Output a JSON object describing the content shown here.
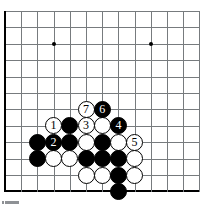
{
  "figure": {
    "kind": "go-board-diagram",
    "caption": "",
    "colors": {
      "background": "#ffffff",
      "grid_line": "#777b7e",
      "board_edge": "#000000",
      "black_stone": "#000000",
      "white_stone": "#ffffff",
      "star_point": "#000000"
    }
  },
  "board": {
    "columns": 13,
    "rows": 12,
    "origin_x": 5,
    "origin_y": 11,
    "spacing_x": 16.2,
    "spacing_y": 16.4,
    "left_edge_is_board_boundary": true,
    "bottom_edge_is_board_boundary": true,
    "star_points": [
      {
        "col": 3,
        "row": 2
      },
      {
        "col": 9,
        "row": 2
      }
    ]
  },
  "stones": [
    {
      "col": 5,
      "row": 6,
      "color": "white",
      "label": "7"
    },
    {
      "col": 6,
      "row": 6,
      "color": "black",
      "label": "6"
    },
    {
      "col": 3,
      "row": 7,
      "color": "white",
      "label": "1"
    },
    {
      "col": 4,
      "row": 7,
      "color": "black",
      "label": ""
    },
    {
      "col": 5,
      "row": 7,
      "color": "white",
      "label": "3"
    },
    {
      "col": 6,
      "row": 7,
      "color": "white",
      "label": ""
    },
    {
      "col": 7,
      "row": 7,
      "color": "black",
      "label": "4"
    },
    {
      "col": 2,
      "row": 8,
      "color": "black",
      "label": ""
    },
    {
      "col": 3,
      "row": 8,
      "color": "black",
      "label": "2"
    },
    {
      "col": 4,
      "row": 8,
      "color": "black",
      "label": ""
    },
    {
      "col": 5,
      "row": 8,
      "color": "white",
      "label": ""
    },
    {
      "col": 6,
      "row": 8,
      "color": "black",
      "label": ""
    },
    {
      "col": 7,
      "row": 8,
      "color": "white",
      "label": ""
    },
    {
      "col": 8,
      "row": 8,
      "color": "white",
      "label": "5"
    },
    {
      "col": 2,
      "row": 9,
      "color": "black",
      "label": ""
    },
    {
      "col": 3,
      "row": 9,
      "color": "white",
      "label": ""
    },
    {
      "col": 4,
      "row": 9,
      "color": "white",
      "label": ""
    },
    {
      "col": 5,
      "row": 9,
      "color": "black",
      "label": ""
    },
    {
      "col": 6,
      "row": 9,
      "color": "black",
      "label": ""
    },
    {
      "col": 7,
      "row": 9,
      "color": "black",
      "label": ""
    },
    {
      "col": 8,
      "row": 9,
      "color": "white",
      "label": ""
    },
    {
      "col": 5,
      "row": 10,
      "color": "white",
      "label": ""
    },
    {
      "col": 6,
      "row": 10,
      "color": "white",
      "label": ""
    },
    {
      "col": 7,
      "row": 10,
      "color": "black",
      "label": ""
    },
    {
      "col": 8,
      "row": 10,
      "color": "white",
      "label": ""
    },
    {
      "col": 7,
      "row": 11,
      "color": "black",
      "label": ""
    }
  ],
  "move_sequence": [
    {
      "number": "1",
      "color": "white"
    },
    {
      "number": "2",
      "color": "black"
    },
    {
      "number": "3",
      "color": "white"
    },
    {
      "number": "4",
      "color": "black"
    },
    {
      "number": "5",
      "color": "white"
    },
    {
      "number": "6",
      "color": "black"
    },
    {
      "number": "7",
      "color": "white"
    }
  ]
}
